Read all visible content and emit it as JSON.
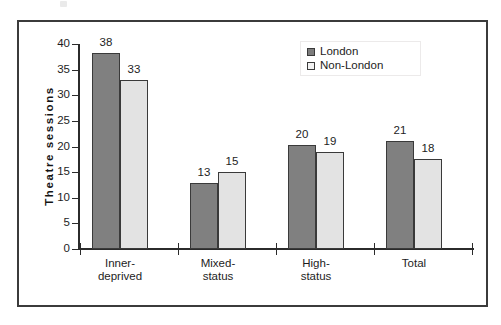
{
  "chart_data": {
    "type": "bar",
    "title": "",
    "xlabel": "",
    "ylabel": "Theatre  sessions",
    "ylim": [
      0,
      40
    ],
    "ytick_step": 5,
    "yticks": [
      "40",
      "35",
      "30",
      "25",
      "20",
      "15",
      "10",
      "5",
      "0"
    ],
    "grid": false,
    "legend_position": "top-right",
    "categories": [
      "Inner-\ndeprived",
      "Mixed-\nstatus",
      "High-\nstatus",
      "Total"
    ],
    "series": [
      {
        "name": "London",
        "values": [
          38,
          33,
          20,
          21
        ],
        "color": "#808080"
      },
      {
        "name": "Non-London",
        "values": [
          33,
          15,
          19,
          18
        ],
        "color": "#e3e3e3"
      }
    ],
    "bars": [
      {
        "group": "Inner-deprived",
        "series": "London",
        "value": 38,
        "label": "38",
        "plot_value": 38.3
      },
      {
        "group": "Inner-deprived",
        "series": "Non-London",
        "value": 33,
        "label": "33",
        "plot_value": 33.0
      },
      {
        "group": "Mixed-status",
        "series": "London",
        "value": 13,
        "label": "13",
        "plot_value": 12.8
      },
      {
        "group": "Mixed-status",
        "series": "Non-London",
        "value": 15,
        "label": "15",
        "plot_value": 15.1
      },
      {
        "group": "High-status",
        "series": "London",
        "value": 20,
        "label": "20",
        "plot_value": 20.2
      },
      {
        "group": "High-status",
        "series": "Non-London",
        "value": 19,
        "label": "19",
        "plot_value": 19.0
      },
      {
        "group": "Total",
        "series": "London",
        "value": 21,
        "label": "21",
        "plot_value": 21.0
      },
      {
        "group": "Total",
        "series": "Total-NonLondon",
        "value": 18,
        "label": "18",
        "plot_value": 17.6
      }
    ]
  },
  "legend": {
    "items": [
      {
        "label": "London",
        "swatch": "dark-gray-square"
      },
      {
        "label": "Non-London",
        "swatch": "light-gray-square"
      }
    ]
  },
  "axis": {
    "y_title": "Theatre  sessions",
    "y_tick_labels": [
      "40",
      "35",
      "30",
      "25",
      "20",
      "15",
      "10",
      "5",
      "0"
    ],
    "x_tick_labels": [
      "Inner-\ndeprived",
      "Mixed-\nstatus",
      "High-\nstatus",
      "Total"
    ]
  }
}
